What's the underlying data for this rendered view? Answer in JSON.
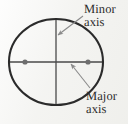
{
  "figure": {
    "kind": "ellipse-axes-diagram",
    "background_color": "#f4f4f2",
    "ink_color": "#2b2b2b",
    "annotation_color": "#7a7a7a",
    "labels": {
      "minor_axis": {
        "line1": "Minor",
        "line2": "axis"
      },
      "major_axis": {
        "line1": "Major",
        "line2": "axis"
      }
    },
    "shapes": {
      "ellipse": {
        "center_x": 56,
        "center_y": 62,
        "radius_x": 47,
        "radius_y": 43,
        "stroke_color": "#2b2b2b",
        "stroke_width": 2.1
      },
      "major_axis_line": {
        "x1": 9,
        "y1": 62,
        "x2": 103,
        "y2": 62,
        "stroke_color": "#4a4a4a",
        "stroke_width": 1.3
      },
      "minor_axis_line": {
        "x1": 56,
        "y1": 19,
        "x2": 56,
        "y2": 105,
        "stroke_color": "#4a4a4a",
        "stroke_width": 1.3
      },
      "focus_left": {
        "cx": 25,
        "cy": 62,
        "r": 2.6,
        "fill": "#6e6e6e"
      },
      "focus_right": {
        "cx": 88,
        "cy": 62,
        "r": 2.6,
        "fill": "#6e6e6e"
      },
      "minor_axis_pointer": {
        "from_x": 83,
        "from_y": 16,
        "to_x": 58,
        "to_y": 35,
        "stroke_color": "#8a8a8a",
        "stroke_width": 1.1
      },
      "major_axis_pointer": {
        "from_x": 90,
        "from_y": 88,
        "to_x": 71,
        "to_y": 64,
        "stroke_color": "#8a8a8a",
        "stroke_width": 1.1
      }
    }
  }
}
